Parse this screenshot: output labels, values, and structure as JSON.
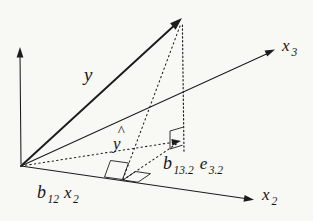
{
  "figure": {
    "background": "#f8f8f5",
    "ink": "#1c1c1c",
    "labels": {
      "y_vector": "y",
      "y_hat": {
        "caret": "^",
        "letter": "y"
      },
      "x3": {
        "main": "x",
        "sub": "3"
      },
      "x2": {
        "main": "x",
        "sub": "2"
      },
      "b12x2": {
        "b": "b",
        "b_sub": "12",
        "x": "x",
        "x_sub": "2"
      },
      "b13e32": {
        "b": "b",
        "b_sub": "13.2",
        "e": "e",
        "e_sub": "3.2"
      }
    },
    "geometry": {
      "vertical_axis_line": "M21,164 L20,53",
      "vertical_axis_arrow": "M20,47 L16.6,57.5 L23.4,57.5 Z",
      "x2_axis_line": "M21,166 L245,198.4",
      "x2_axis_arrow": "M254,199.8 L243.5,201.8 L244.6,195.1 Z",
      "x3_axis_line": "M21,166 L266.5,54",
      "x3_axis_arrow": "M275,49.5 L267.2,56.6 L264.6,50.6 Z",
      "y_vector_line": "M21,166 L174.5,25.2",
      "y_vector_arrow": "M182,18 L175.6,29.7 L170.1,23.3 Z",
      "y_hat_line": "M21,166 L172.5,142.4",
      "y_hat_arrow": "M181,141 L172.3,145.7 L171.4,139.1 Z",
      "residual_line": "M182.4,25 L184,152.5",
      "perp_from_y_line": "M123,179 L180,26",
      "b13_component_line": "M123,180 L178.5,142.6",
      "tip_right_angle_marker": "M183,127.2 L170,131 L170,149 L182.5,145.2",
      "x2_right_angle_marker_left": "M122.5,179.5 L104.5,177 L110.5,160.5 L128.5,163 Z",
      "x2_right_angle_marker_right": "M123,180 L135.5,171.5 L150.5,173.7 L138,182.2 Z"
    }
  }
}
